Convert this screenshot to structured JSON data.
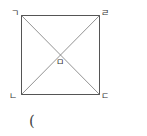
{
  "figure": {
    "shape": "square",
    "vertices": {
      "top_left": "ㄱ",
      "top_right": "ㄹ",
      "bottom_left": "ㄴ",
      "bottom_right": "ㄷ"
    },
    "center_label": "ㅁ",
    "stroke_color": "#555555",
    "diagonal_color": "#777777"
  },
  "answer": {
    "open_paren": "("
  }
}
